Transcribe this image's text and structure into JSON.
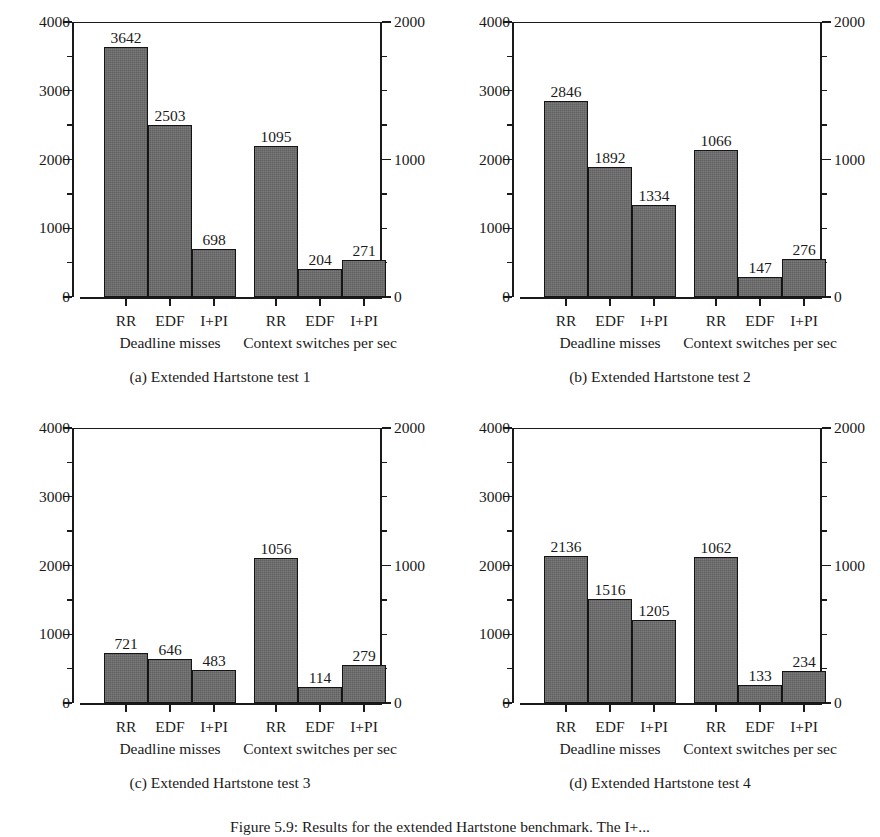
{
  "figure": {
    "caption_fragment": "Figure 5.9:   Results for the extended Hartstone benchmark. The I+..."
  },
  "axes": {
    "left_ticks": [
      "0",
      "1000",
      "2000",
      "3000",
      "4000"
    ],
    "right_ticks": [
      "0",
      "1000",
      "2000"
    ],
    "left_max": 4000,
    "right_max": 2000,
    "left_minor_step": 500,
    "right_minor_step": 250,
    "categories": [
      "RR",
      "EDF",
      "I+PI"
    ],
    "group_labels": [
      "Deadline misses",
      "Context switches per sec"
    ]
  },
  "chart_data": [
    {
      "type": "bar",
      "id": "panel-a",
      "title": "(a) Extended Hartstone test 1",
      "categories": [
        "RR",
        "EDF",
        "I+PI"
      ],
      "xlabel": "",
      "ylabel": "",
      "ylim": [
        0,
        4000
      ],
      "y2lim": [
        0,
        2000
      ],
      "grid": false,
      "legend": "none",
      "series": [
        {
          "name": "Deadline misses",
          "axis": "left",
          "values": [
            3642,
            2503,
            698
          ]
        },
        {
          "name": "Context switches per sec",
          "axis": "right",
          "values": [
            1095,
            204,
            271
          ]
        }
      ]
    },
    {
      "type": "bar",
      "id": "panel-b",
      "title": "(b) Extended Hartstone test 2",
      "categories": [
        "RR",
        "EDF",
        "I+PI"
      ],
      "xlabel": "",
      "ylabel": "",
      "ylim": [
        0,
        4000
      ],
      "y2lim": [
        0,
        2000
      ],
      "grid": false,
      "legend": "none",
      "series": [
        {
          "name": "Deadline misses",
          "axis": "left",
          "values": [
            2846,
            1892,
            1334
          ]
        },
        {
          "name": "Context switches per sec",
          "axis": "right",
          "values": [
            1066,
            147,
            276
          ]
        }
      ]
    },
    {
      "type": "bar",
      "id": "panel-c",
      "title": "(c) Extended Hartstone test 3",
      "categories": [
        "RR",
        "EDF",
        "I+PI"
      ],
      "xlabel": "",
      "ylabel": "",
      "ylim": [
        0,
        4000
      ],
      "y2lim": [
        0,
        2000
      ],
      "grid": false,
      "legend": "none",
      "series": [
        {
          "name": "Deadline misses",
          "axis": "left",
          "values": [
            721,
            646,
            483
          ]
        },
        {
          "name": "Context switches per sec",
          "axis": "right",
          "values": [
            1056,
            114,
            279
          ]
        }
      ]
    },
    {
      "type": "bar",
      "id": "panel-d",
      "title": "(d) Extended Hartstone test 4",
      "categories": [
        "RR",
        "EDF",
        "I+PI"
      ],
      "xlabel": "",
      "ylabel": "",
      "ylim": [
        0,
        4000
      ],
      "y2lim": [
        0,
        2000
      ],
      "grid": false,
      "legend": "none",
      "series": [
        {
          "name": "Deadline misses",
          "axis": "left",
          "values": [
            2136,
            1516,
            1205
          ]
        },
        {
          "name": "Context switches per sec",
          "axis": "right",
          "values": [
            1062,
            133,
            234
          ]
        }
      ]
    }
  ],
  "colors": {
    "bar_fill": "#6b6b6b",
    "bar_stroke": "#141414",
    "axis": "#1a1a1a",
    "background": "#ffffff"
  }
}
